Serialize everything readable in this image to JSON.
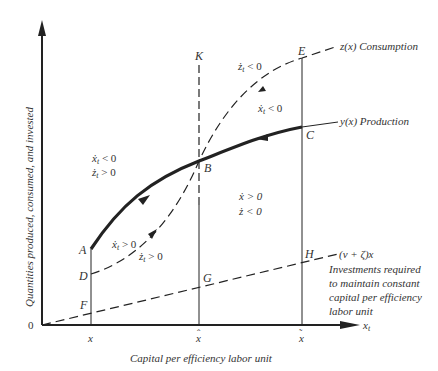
{
  "figure": {
    "y_axis_label": "Quantities produced, consumed, and invested",
    "x_axis_label": "Capital per efficiency labor unit",
    "x_axis_symbol": "x",
    "x_axis_subscript": "t",
    "origin_label": "0",
    "x_ticks": [
      {
        "label": "x",
        "accent": ""
      },
      {
        "label": "x",
        "accent": "ˆ"
      },
      {
        "label": "x",
        "accent": "˜"
      }
    ],
    "points": {
      "A": "A",
      "B": "B",
      "C": "C",
      "D": "D",
      "E": "E",
      "F": "F",
      "G": "G",
      "H": "H",
      "K": "K"
    },
    "curves": {
      "consumption": "z(x) Consumption",
      "production": "y(x) Production",
      "investment": "(ν + ζ)x",
      "investment_note": [
        "Investments required",
        "to maintain constant",
        "capital per efficiency",
        "labor unit"
      ]
    },
    "region_labels": {
      "upper_left": {
        "line1": "ẋ",
        "line1_sub": "t",
        "line1_rel": " < 0",
        "line2": "ż",
        "line2_sub": "t",
        "line2_rel": " > 0"
      },
      "lower_left_x": {
        "sym": "ẋ",
        "sub": "t",
        "rel": " > 0"
      },
      "lower_left_z": {
        "sym": "ż",
        "sub": "t",
        "rel": " > 0"
      },
      "upper_right_z": {
        "sym": "ż",
        "sub": "t",
        "rel": " < 0"
      },
      "upper_right_x": {
        "sym": "ẋ",
        "sub": "t",
        "rel": " < 0"
      },
      "middle_right": {
        "line1": "ẋ > 0",
        "line2": "ż < 0"
      }
    },
    "colors": {
      "ink": "#222222",
      "text": "#333333",
      "background": "#ffffff"
    }
  }
}
